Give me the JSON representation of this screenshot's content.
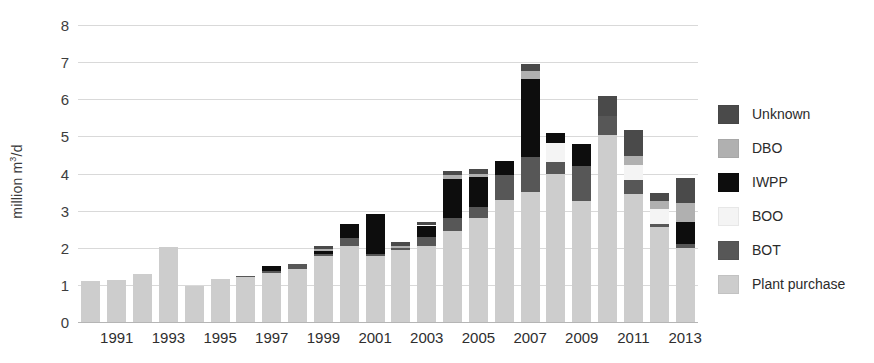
{
  "chart_data": {
    "type": "bar",
    "stacked": true,
    "title": "",
    "xlabel": "",
    "ylabel": "million m3/d",
    "ylabel_html": "million m³/d",
    "ylim": [
      0,
      8
    ],
    "ytick_values": [
      0,
      1,
      2,
      3,
      4,
      5,
      6,
      7,
      8
    ],
    "ytick_labels": [
      "0",
      "1",
      "2",
      "3",
      "4",
      "5",
      "6",
      "7",
      "8"
    ],
    "grid": true,
    "legend_position": "right",
    "categories": [
      "1990",
      "1991",
      "1992",
      "1993",
      "1994",
      "1995",
      "1996",
      "1997",
      "1998",
      "1999",
      "2000",
      "2001",
      "2002",
      "2003",
      "2004",
      "2005",
      "2006",
      "2007",
      "2008",
      "2009",
      "2010",
      "2011",
      "2012",
      "2013"
    ],
    "xtick_labels": [
      "1991",
      "1993",
      "1995",
      "1997",
      "1999",
      "2001",
      "2003",
      "2005",
      "2007",
      "2009",
      "2011",
      "2013"
    ],
    "series": [
      {
        "name": "Plant purchase",
        "color": "#cdcdcd",
        "values": [
          1.1,
          1.12,
          1.28,
          2.03,
          0.96,
          1.17,
          1.2,
          1.33,
          1.42,
          1.78,
          2.05,
          1.78,
          1.95,
          2.05,
          2.45,
          2.8,
          3.3,
          3.5,
          4.0,
          3.25,
          5.05,
          3.45,
          2.55,
          2.0
        ]
      },
      {
        "name": "BOT",
        "color": "#575757",
        "values": [
          0,
          0,
          0,
          0,
          0,
          0,
          0.04,
          0.04,
          0.14,
          0.04,
          0.22,
          0.05,
          0.05,
          0.25,
          0.35,
          0.3,
          0.65,
          0.95,
          0.32,
          0.95,
          0.5,
          0.38,
          0.1,
          0.1
        ]
      },
      {
        "name": "BOO",
        "color": "#f4f4f4",
        "values": [
          0,
          0,
          0,
          0,
          0,
          0,
          0,
          0,
          0,
          0,
          0,
          0,
          0,
          0,
          0,
          0,
          0,
          0,
          0.5,
          0,
          0,
          0.4,
          0.4,
          0
        ]
      },
      {
        "name": "IWPP",
        "color": "#0d0d0d",
        "values": [
          0,
          0,
          0,
          0,
          0,
          0,
          0,
          0.14,
          0,
          0.08,
          0.38,
          1.08,
          0,
          0.3,
          1.05,
          0.8,
          0.4,
          2.1,
          0.28,
          0.6,
          0,
          0,
          0,
          0.6
        ]
      },
      {
        "name": "DBO",
        "color": "#b0b0b0",
        "values": [
          0,
          0,
          0,
          0,
          0,
          0,
          0,
          0,
          0,
          0.06,
          0,
          0,
          0.05,
          0,
          0.1,
          0.1,
          0,
          0.22,
          0,
          0,
          0,
          0.25,
          0.22,
          0.5
        ]
      },
      {
        "name": "Unknown",
        "color": "#4a4a4a",
        "values": [
          0,
          0,
          0,
          0,
          0,
          0,
          0,
          0,
          0,
          0.08,
          0,
          0,
          0.1,
          0.1,
          0.12,
          0.12,
          0,
          0.18,
          0,
          0,
          0.55,
          0.7,
          0.2,
          0.68
        ]
      }
    ]
  },
  "legend": {
    "items": [
      {
        "label": "Unknown",
        "color": "#4a4a4a"
      },
      {
        "label": "DBO",
        "color": "#b0b0b0"
      },
      {
        "label": "IWPP",
        "color": "#0d0d0d"
      },
      {
        "label": "BOO",
        "color": "#f4f4f4"
      },
      {
        "label": "BOT",
        "color": "#575757"
      },
      {
        "label": "Plant purchase",
        "color": "#cdcdcd"
      }
    ]
  }
}
